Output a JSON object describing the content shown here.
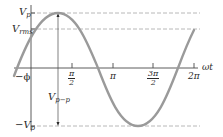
{
  "diagram": {
    "type": "sine-wave-amplitude-diagram",
    "curve_color": "#9a9a9a",
    "axis_color": "#4a4a4a",
    "dashed_color": "#b8b8b8",
    "labels": {
      "vp": "V",
      "vp_sub": "p",
      "vrms": "V",
      "vrms_sub": "rms",
      "neg_vp": "−V",
      "neg_vp_sub": "p",
      "vpp": "V",
      "vpp_sub": "p−p",
      "phase": "−ϕ",
      "x_axis": "ωt"
    },
    "ticks": [
      {
        "id": "pi-half",
        "num": "π",
        "den": "2",
        "fraction": true
      },
      {
        "id": "pi",
        "label": "π",
        "fraction": false
      },
      {
        "id": "three-pi-half",
        "num": "3π",
        "den": "2",
        "fraction": true
      },
      {
        "id": "two-pi",
        "label": "2π",
        "fraction": false
      }
    ]
  }
}
